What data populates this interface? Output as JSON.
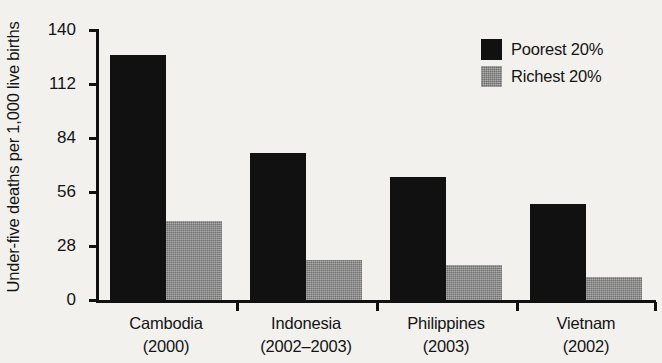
{
  "chart_data": {
    "type": "bar",
    "title": "",
    "xlabel": "",
    "ylabel": "Under-five deaths per 1,000 live births",
    "ylim": [
      0,
      140
    ],
    "yticks": [
      140,
      112,
      84,
      56,
      28,
      0
    ],
    "grid": false,
    "legend_position": "top-right",
    "categories": [
      "Cambodia",
      "Indonesia",
      "Philippines",
      "Vietnam"
    ],
    "category_years": [
      "(2000)",
      "(2002–2003)",
      "(2003)",
      "(2002)"
    ],
    "series": [
      {
        "name": "Poorest 20%",
        "color": "#111111",
        "values": [
          127,
          76,
          64,
          50
        ]
      },
      {
        "name": "Richest 20%",
        "color": "#8a8a8a",
        "values": [
          41,
          21,
          18,
          12
        ]
      }
    ]
  },
  "axis": {
    "tick_labels": [
      "140",
      "112",
      "84",
      "56",
      "28",
      "0"
    ]
  },
  "legend": {
    "items": [
      {
        "label": "Poorest 20%",
        "swatch": "black-square-swatch"
      },
      {
        "label": "Richest 20%",
        "swatch": "gray-square-swatch"
      }
    ]
  }
}
